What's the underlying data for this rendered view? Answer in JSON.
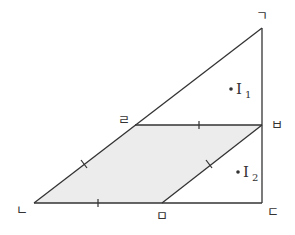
{
  "diagram": {
    "type": "geometry",
    "colors": {
      "stroke": "#333333",
      "fill": "#ececec",
      "background": "#ffffff"
    },
    "vertices": {
      "g": {
        "label": "ㄱ",
        "x": 262,
        "y": 28,
        "lx": 262,
        "ly": 20
      },
      "n": {
        "label": "ㄴ",
        "x": 34,
        "y": 203,
        "lx": 22,
        "ly": 214
      },
      "d": {
        "label": "ㄷ",
        "x": 262,
        "y": 203,
        "lx": 273,
        "ly": 216
      },
      "r": {
        "label": "ㄹ",
        "x": 135,
        "y": 125,
        "lx": 124,
        "ly": 124
      },
      "m": {
        "label": "ㅁ",
        "x": 162,
        "y": 203,
        "lx": 162,
        "ly": 220
      },
      "b": {
        "label": "ㅂ",
        "x": 262,
        "y": 125,
        "lx": 277,
        "ly": 129
      }
    },
    "incenters": [
      {
        "label": "I",
        "sub": "1",
        "x": 231,
        "y": 89
      },
      {
        "label": "I",
        "sub": "2",
        "x": 238,
        "y": 172
      }
    ],
    "shaded_region": "ㄴㅁㅂㄹ",
    "equal_segment_ticks": [
      "ㄴㅁ",
      "ㅁㅂ",
      "ㅂㄹ",
      "ㄹㄴ"
    ]
  }
}
